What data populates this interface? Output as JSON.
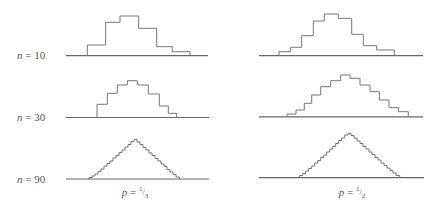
{
  "figure": {
    "line_color": "#777777",
    "axis_color": "#666666"
  },
  "row_labels": [
    {
      "var": "n",
      "eq": " = ",
      "value": "10",
      "x": 17,
      "y": 49
    },
    {
      "var": "n",
      "eq": " = ",
      "value": "30",
      "x": 17,
      "y": 111
    },
    {
      "var": "n",
      "eq": " = ",
      "value": "90",
      "x": 17,
      "y": 173
    }
  ],
  "column_labels": [
    {
      "var": "p",
      "eq": " = ",
      "num": "1",
      "den": "3",
      "x": 135,
      "y": 185
    },
    {
      "var": "p",
      "eq": " = ",
      "num": "1",
      "den": "2",
      "x": 352,
      "y": 185
    }
  ],
  "histograms": [
    {
      "name": "n10-p1-3",
      "baseline": {
        "y": 55.7,
        "x1": 66,
        "x2": 208
      },
      "edges": [
        87.3,
        105.7,
        120,
        138.7,
        156.7,
        172.3,
        190
      ],
      "tops": [
        45,
        22.3,
        16,
        28.3,
        46.7,
        51.7
      ]
    },
    {
      "name": "n10-p1-2",
      "baseline": {
        "y": 55.7,
        "x1": 259,
        "x2": 423
      },
      "edges": [
        279,
        290.7,
        301.7,
        313.3,
        324.3,
        338.3,
        351.7,
        363.3,
        376.7,
        394.3
      ],
      "tops": [
        51.7,
        47.3,
        35.7,
        21,
        14,
        18.3,
        34.3,
        45.7,
        50
      ]
    },
    {
      "name": "n30-p1-3",
      "baseline": {
        "y": 117.5,
        "x1": 66,
        "x2": 209
      },
      "edges": [
        97,
        107.3,
        117.3,
        127.3,
        137.3,
        148.3,
        159.3,
        168.3,
        176.7
      ],
      "tops": [
        104.3,
        93.3,
        85,
        80.7,
        85,
        94,
        106,
        113.3
      ]
    },
    {
      "name": "n30-p1-2",
      "baseline": {
        "y": 116.8,
        "x1": 259,
        "x2": 423
      },
      "edges": [
        287,
        296,
        304.3,
        311.7,
        320.7,
        330.7,
        340.7,
        350,
        360,
        370,
        379.3,
        389,
        398.3,
        408.3
      ],
      "tops": [
        114,
        110,
        103.3,
        95,
        86.7,
        80.7,
        75,
        78.3,
        85,
        91.7,
        100,
        107.7,
        111.7
      ]
    },
    {
      "name": "n90-p1-3",
      "baseline": {
        "y": 179,
        "x1": 66,
        "x2": 209
      },
      "edges": [
        89,
        92,
        95,
        98,
        101,
        104,
        107,
        110,
        113,
        116,
        119,
        122,
        125,
        128,
        131,
        134,
        137,
        140,
        143,
        146,
        149,
        152,
        155,
        158,
        161,
        164,
        167,
        170,
        173,
        176,
        179.5
      ],
      "tops": [
        177.5,
        176,
        174,
        171.5,
        169,
        166,
        163.5,
        161,
        158,
        155.5,
        152.5,
        150,
        147,
        144.5,
        141.5,
        139.5,
        142,
        144.5,
        147.5,
        150,
        153,
        155.5,
        158.5,
        161,
        164,
        166.5,
        169.5,
        172,
        174.5,
        177
      ]
    },
    {
      "name": "n90-p1-2",
      "baseline": {
        "y": 177.7,
        "x1": 259,
        "x2": 424
      },
      "edges": [
        299.7,
        302.7,
        305.7,
        308.7,
        311.7,
        314.7,
        317.7,
        320.7,
        323.7,
        326.7,
        329.7,
        332.7,
        335.7,
        338.7,
        341.7,
        344.7,
        348,
        351,
        354,
        357,
        360,
        363,
        366,
        369,
        372,
        375,
        378,
        381,
        384,
        387,
        390,
        393,
        396,
        399.7
      ],
      "tops": [
        175.5,
        173.5,
        171,
        168.5,
        166,
        163,
        160.5,
        157.5,
        155,
        152,
        149,
        146.5,
        143.5,
        140.5,
        138,
        135,
        133.3,
        135.5,
        138,
        141,
        143.5,
        146.5,
        149,
        152,
        154.5,
        157.5,
        160,
        163,
        165.5,
        168,
        170.5,
        173,
        175.5
      ]
    }
  ]
}
